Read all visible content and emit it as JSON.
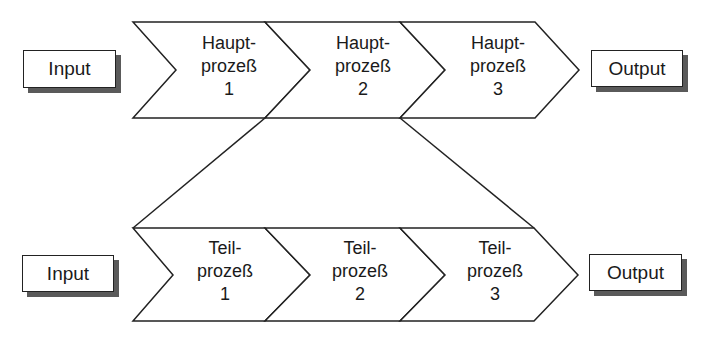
{
  "diagram": {
    "type": "process-decomposition",
    "colors": {
      "stroke": "#222222",
      "shadow": "#5a5a5a",
      "fill": "#ffffff"
    },
    "top_row": {
      "input_label": "Input",
      "output_label": "Output",
      "processes": [
        {
          "line1": "Haupt-",
          "line2": "prozeß",
          "number": "1"
        },
        {
          "line1": "Haupt-",
          "line2": "prozeß",
          "number": "2"
        },
        {
          "line1": "Haupt-",
          "line2": "prozeß",
          "number": "3"
        }
      ]
    },
    "bottom_row": {
      "input_label": "Input",
      "output_label": "Output",
      "processes": [
        {
          "line1": "Teil-",
          "line2": "prozeß",
          "number": "1"
        },
        {
          "line1": "Teil-",
          "line2": "prozeß",
          "number": "2"
        },
        {
          "line1": "Teil-",
          "line2": "prozeß",
          "number": "3"
        }
      ]
    },
    "expansion": {
      "from": "Hauptprozeß 2",
      "to": "Teilprozeß 1-3"
    }
  }
}
